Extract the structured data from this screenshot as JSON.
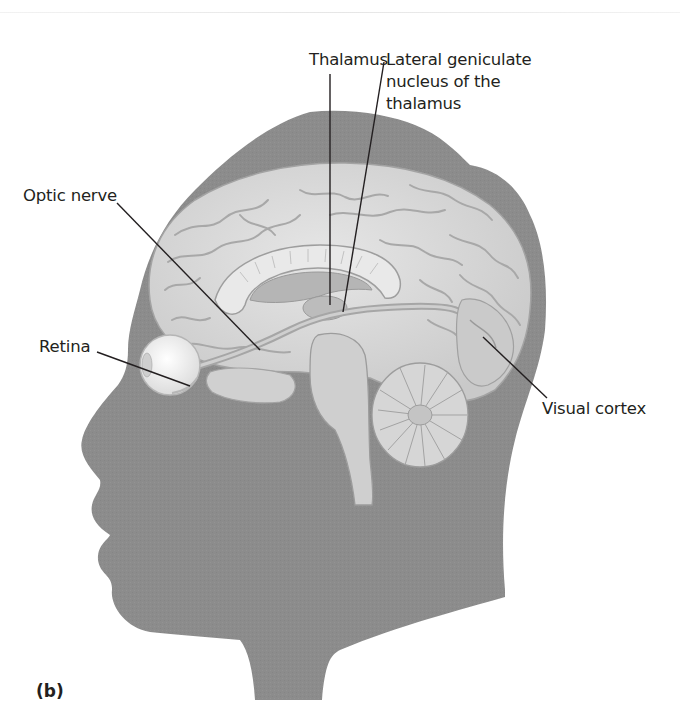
{
  "figure": {
    "panel_label": "(b)",
    "labels": {
      "thalamus": "Thalamus",
      "lgn_line1": "Lateral geniculate",
      "lgn_line2": "nucleus of the",
      "lgn_line3": "thalamus",
      "optic_nerve": "Optic nerve",
      "retina": "Retina",
      "visual_cortex": "Visual cortex"
    },
    "colors": {
      "head": "#8c8c8c",
      "brain": "#d9d9d9",
      "brain_fold": "#a8a8a8",
      "eye": "#f2f2f2",
      "leader_line": "#231f20",
      "text": "#231f20"
    }
  }
}
